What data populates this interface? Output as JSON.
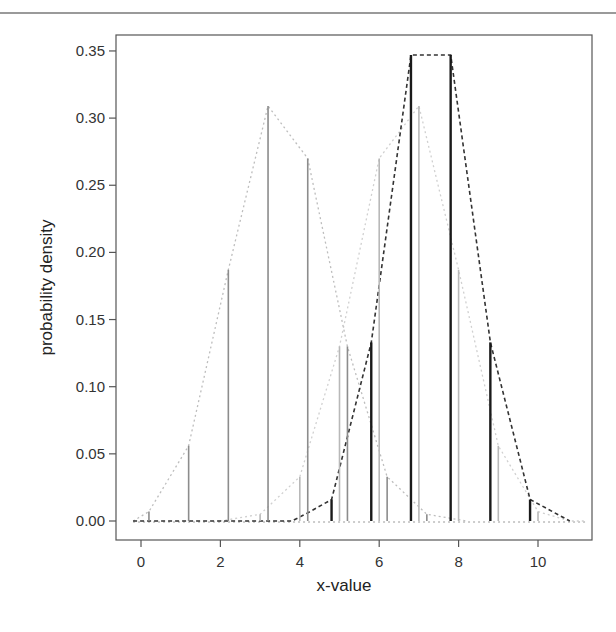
{
  "chart_data": {
    "type": "line",
    "subtype": "discrete-probability-mass (vertical spikes with connecting dashed lines)",
    "title": "",
    "xlabel": "x-value",
    "ylabel": "probability density",
    "xlim": [
      -0.4,
      11.4
    ],
    "ylim": [
      -0.013,
      0.362
    ],
    "x_ticks": [
      0,
      2,
      4,
      6,
      8,
      10
    ],
    "x_tick_labels": [
      "0",
      "2",
      "4",
      "6",
      "8",
      "10"
    ],
    "y_ticks": [
      0.0,
      0.05,
      0.1,
      0.15,
      0.2,
      0.25,
      0.3,
      0.35
    ],
    "y_tick_labels": [
      "0.00",
      "0.05",
      "0.10",
      "0.15",
      "0.20",
      "0.25",
      "0.30",
      "0.35"
    ],
    "grid": false,
    "legend": null,
    "series": [
      {
        "name": "distribution A (medium gray, peak near 3.2)",
        "color": "#8c8c8c",
        "line_color": "#bdbdbd",
        "line_style": "dotted",
        "spike_width": 1.6,
        "x": [
          0.2,
          1.2,
          2.2,
          3.2,
          4.2,
          5.2,
          6.2,
          7.2
        ],
        "values": [
          0.007,
          0.056,
          0.187,
          0.309,
          0.27,
          0.13,
          0.033,
          0.005
        ],
        "line_x": [
          -0.2,
          0.2,
          1.2,
          2.2,
          3.2,
          4.2,
          5.2,
          6.2,
          7.2,
          8.2
        ],
        "line_y": [
          0.0,
          0.007,
          0.056,
          0.187,
          0.309,
          0.27,
          0.13,
          0.033,
          0.005,
          0.0
        ]
      },
      {
        "name": "distribution B (light gray, peak near 7.0)",
        "color": "#b8b8b8",
        "line_color": "#d0d0d0",
        "line_style": "dotted",
        "spike_width": 1.6,
        "x": [
          3.0,
          4.0,
          5.0,
          6.0,
          7.0,
          8.0,
          9.0,
          10.0
        ],
        "values": [
          0.005,
          0.033,
          0.13,
          0.27,
          0.309,
          0.187,
          0.056,
          0.007
        ],
        "line_x": [
          2.0,
          3.0,
          4.0,
          5.0,
          6.0,
          7.0,
          8.0,
          9.0,
          10.0,
          10.8,
          11.2
        ],
        "line_y": [
          0.0,
          0.005,
          0.033,
          0.13,
          0.27,
          0.309,
          0.187,
          0.056,
          0.007,
          0.0,
          0.0
        ]
      },
      {
        "name": "distribution C (black, symmetric around 7.3)",
        "color": "#1a1a1a",
        "line_color": "#333333",
        "line_style": "dashed",
        "spike_width": 2.4,
        "x": [
          4.8,
          5.8,
          6.8,
          7.8,
          8.8,
          9.8
        ],
        "values": [
          0.016,
          0.133,
          0.347,
          0.347,
          0.133,
          0.016
        ],
        "line_x": [
          -0.2,
          3.8,
          4.2,
          4.8,
          5.8,
          6.8,
          7.8,
          8.8,
          9.8,
          10.8
        ],
        "line_y": [
          0.0,
          0.0,
          0.006,
          0.016,
          0.133,
          0.347,
          0.347,
          0.133,
          0.016,
          0.0
        ]
      }
    ],
    "baseline_dotted": {
      "color": "#9a9a9a",
      "x": [
        -0.2,
        11.2
      ],
      "y": [
        0.0,
        0.0
      ]
    }
  },
  "layout": {
    "plot_box": {
      "left": 116,
      "top": 35,
      "right": 592,
      "bottom": 540
    },
    "x_map": {
      "x0_value": 0,
      "x0_px": 141,
      "px_per_unit": 39.7
    },
    "y_map": {
      "y0_value": 0,
      "y0_px": 521,
      "px_per_unit": 1343
    }
  }
}
